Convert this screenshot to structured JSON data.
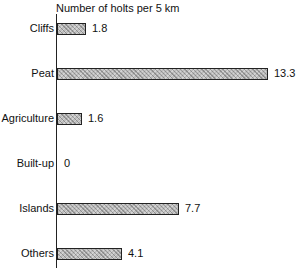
{
  "chart_data": {
    "type": "bar",
    "orientation": "horizontal",
    "title": "Number of holts per 5 km",
    "xlabel": "Number of holts per 5 km",
    "ylabel": "",
    "categories": [
      "Cliffs",
      "Peat",
      "Agriculture",
      "Built-up",
      "Islands",
      "Others"
    ],
    "values": [
      1.8,
      13.3,
      1.6,
      0,
      7.7,
      4.1
    ],
    "value_labels": [
      "1.8",
      "13.3",
      "1.6",
      "0",
      "7.7",
      "4.1"
    ],
    "xlim": [
      0,
      13.3
    ],
    "grid": false,
    "legend": null,
    "bar_fill": "hatched grey"
  }
}
